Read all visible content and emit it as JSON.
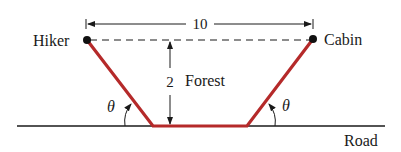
{
  "diagram": {
    "labels": {
      "hiker": "Hiker",
      "cabin": "Cabin",
      "forest": "Forest",
      "road": "Road",
      "width": "10",
      "height": "2",
      "angle_left": "θ",
      "angle_right": "θ"
    },
    "colors": {
      "path": "#b52a2a",
      "line": "#1a1a1a",
      "background": "#ffffff"
    },
    "points": {
      "hiker": [
        87,
        40
      ],
      "cabin": [
        313,
        39
      ],
      "road_left_corner": [
        153,
        126
      ],
      "road_right_corner": [
        247,
        126
      ]
    }
  }
}
